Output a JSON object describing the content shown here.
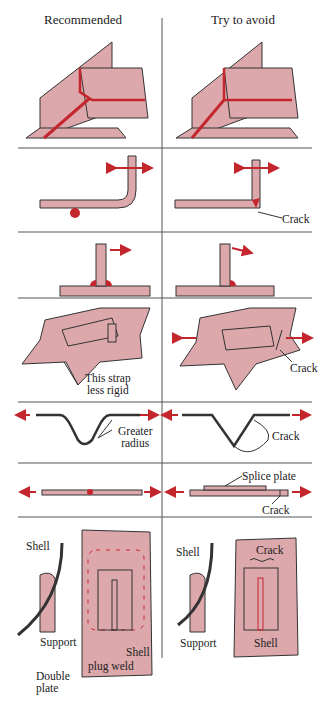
{
  "headers": {
    "left": "Recommended",
    "right": "Try to avoid"
  },
  "colors": {
    "plate": "#dca8ab",
    "weld": "#c4262e",
    "line": "#333333",
    "divider": "#555555"
  },
  "rows": [
    {
      "name": "corner-gusset",
      "left_labels": [],
      "right_labels": []
    },
    {
      "name": "bent-bar",
      "left_labels": [],
      "right_labels": [
        "Crack"
      ]
    },
    {
      "name": "t-joint",
      "left_labels": [],
      "right_labels": []
    },
    {
      "name": "strap",
      "left_labels": [
        "This strap",
        "less rigid"
      ],
      "right_labels": [
        "Crack"
      ]
    },
    {
      "name": "corrugation",
      "left_labels": [
        "Greater",
        "radius"
      ],
      "right_labels": [
        "Crack"
      ]
    },
    {
      "name": "splice",
      "left_labels": [],
      "right_labels": [
        "Splice plate",
        "Crack"
      ]
    },
    {
      "name": "shell-support",
      "left_labels": [
        "Shell",
        "Support",
        "Double",
        "plate",
        "Shell",
        "plug weld"
      ],
      "right_labels": [
        "Shell",
        "Support",
        "Crack",
        "Shell"
      ]
    }
  ]
}
